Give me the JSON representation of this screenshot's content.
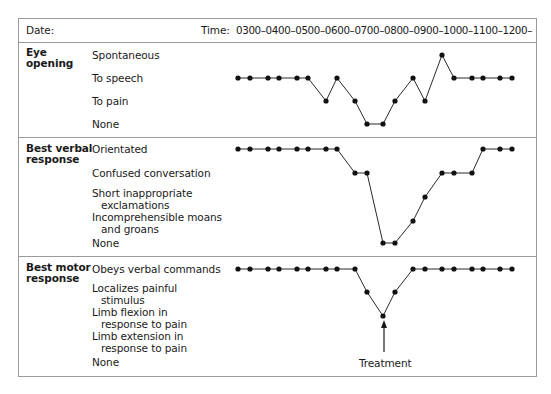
{
  "header": {
    "date_label": "Date:",
    "time_label": "Time:",
    "time_scale": "0300–0400–0500–0600–0700–0800–0900–1000–1100–1200–"
  },
  "sections": [
    {
      "title_line1": "Eye",
      "title_line2": "opening",
      "levels": [
        {
          "line1": "Spontaneous",
          "line2": ""
        },
        {
          "line1": "To speech",
          "line2": ""
        },
        {
          "line1": "To pain",
          "line2": ""
        },
        {
          "line1": "None",
          "line2": ""
        }
      ]
    },
    {
      "title_line1": "Best verbal",
      "title_line2": "response",
      "levels": [
        {
          "line1": "Orientated",
          "line2": ""
        },
        {
          "line1": "Confused conversation",
          "line2": ""
        },
        {
          "line1": "Short inappropriate",
          "line2": "exclamations"
        },
        {
          "line1": "Incomprehensible moans",
          "line2": "and groans"
        },
        {
          "line1": "None",
          "line2": ""
        }
      ]
    },
    {
      "title_line1": "Best motor",
      "title_line2": "response",
      "levels": [
        {
          "line1": "Obeys verbal commands",
          "line2": ""
        },
        {
          "line1": "Localizes painful",
          "line2": "stimulus"
        },
        {
          "line1": "Limb flexion in",
          "line2": "response to pain"
        },
        {
          "line1": "Limb extension in",
          "line2": "response to pain"
        },
        {
          "line1": "None",
          "line2": ""
        }
      ]
    }
  ],
  "annotation": {
    "label": "Treatment"
  },
  "chart_data": {
    "type": "line",
    "xlabel": "Time",
    "x_ticks": [
      "0300",
      "0400",
      "0500",
      "0600",
      "0700",
      "0800",
      "0900",
      "1000",
      "1100",
      "1200"
    ],
    "x": [
      238,
      250,
      268,
      279,
      297,
      308,
      326,
      337,
      355,
      367,
      383,
      395,
      413,
      425,
      442,
      454,
      472,
      483,
      500,
      512
    ],
    "grid": false,
    "series": [
      {
        "name": "Eye opening",
        "levels": [
          "Spontaneous",
          "To speech",
          "To pain",
          "None"
        ],
        "values": [
          "To speech",
          "To speech",
          "To speech",
          "To speech",
          "To speech",
          "To speech",
          "To pain",
          "To speech",
          "To pain",
          "None",
          "None",
          "To pain",
          "To speech",
          "To pain",
          "Spontaneous",
          "To speech",
          "To speech",
          "To speech",
          "To speech",
          "To speech"
        ],
        "scores": [
          3,
          3,
          3,
          3,
          3,
          3,
          2,
          3,
          2,
          1,
          1,
          2,
          3,
          2,
          4,
          3,
          3,
          3,
          3,
          3
        ]
      },
      {
        "name": "Best verbal response",
        "levels": [
          "Orientated",
          "Confused conversation",
          "Short inappropriate exclamations",
          "Incomprehensible moans and groans",
          "None"
        ],
        "values": [
          "Orientated",
          "Orientated",
          "Orientated",
          "Orientated",
          "Orientated",
          "Orientated",
          "Orientated",
          "Orientated",
          "Confused conversation",
          "Confused conversation",
          "None",
          "None",
          "Incomprehensible moans and groans",
          "Short inappropriate exclamations",
          "Confused conversation",
          "Confused conversation",
          "Confused conversation",
          "Orientated",
          "Orientated",
          "Orientated"
        ],
        "scores": [
          5,
          5,
          5,
          5,
          5,
          5,
          5,
          5,
          4,
          4,
          1,
          1,
          2,
          3,
          4,
          4,
          4,
          5,
          5,
          5
        ]
      },
      {
        "name": "Best motor response",
        "levels": [
          "Obeys verbal commands",
          "Localizes painful stimulus",
          "Limb flexion in response to pain",
          "Limb extension in response to pain",
          "None"
        ],
        "values": [
          "Obeys verbal commands",
          "Obeys verbal commands",
          "Obeys verbal commands",
          "Obeys verbal commands",
          "Obeys verbal commands",
          "Obeys verbal commands",
          "Obeys verbal commands",
          "Obeys verbal commands",
          "Obeys verbal commands",
          "Localizes painful stimulus",
          "Limb flexion in response to pain",
          "Localizes painful stimulus",
          "Obeys verbal commands",
          "Obeys verbal commands",
          "Obeys verbal commands",
          "Obeys verbal commands",
          "Obeys verbal commands",
          "Obeys verbal commands",
          "Obeys verbal commands",
          "Obeys verbal commands"
        ],
        "scores": [
          5,
          5,
          5,
          5,
          5,
          5,
          5,
          5,
          5,
          4,
          3,
          4,
          5,
          5,
          5,
          5,
          5,
          5,
          5,
          5
        ]
      }
    ],
    "annotations": [
      {
        "text": "Treatment",
        "series": "Best motor response",
        "point_index": 10,
        "style": "upward arrow"
      }
    ]
  }
}
